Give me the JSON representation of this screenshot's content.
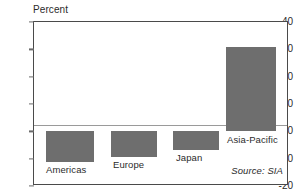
{
  "chart_data": {
    "type": "bar",
    "title": "",
    "subtitle": "",
    "xlabel": "",
    "ylabel": "Percent",
    "categories": [
      "Americas",
      "Europe",
      "Japan",
      "Asia-Pacific"
    ],
    "values": [
      -11.4,
      -9.4,
      -7.0,
      31.0
    ],
    "ylim": [
      -20,
      40
    ],
    "yticks": [
      40,
      30,
      20,
      10,
      0,
      -10,
      -20
    ],
    "ytick_labels": [
      "40",
      "30",
      "20",
      "10",
      "0",
      "-10",
      "-20"
    ],
    "grid": false,
    "legend": "none",
    "annotations": [
      "Source: SIA"
    ],
    "bar_color": "#6e6e6e",
    "frame_color": "#4a4a4a",
    "zero_line_color": "#9a9a9a"
  },
  "axis": {
    "y_title": "Percent",
    "ticks": [
      {
        "label": "40",
        "value": 40
      },
      {
        "label": "30",
        "value": 30
      },
      {
        "label": "20",
        "value": 20
      },
      {
        "label": "10",
        "value": 10
      },
      {
        "label": "0",
        "value": 0
      },
      {
        "label": "-10",
        "value": -10
      },
      {
        "label": "-20",
        "value": -20
      }
    ]
  },
  "bars": [
    {
      "label": "Americas",
      "value": -11.4
    },
    {
      "label": "Europe",
      "value": -9.4
    },
    {
      "label": "Japan",
      "value": -7.0
    },
    {
      "label": "Asia-Pacific",
      "value": 31.0
    }
  ],
  "footer": {
    "source": "Source: SIA"
  }
}
